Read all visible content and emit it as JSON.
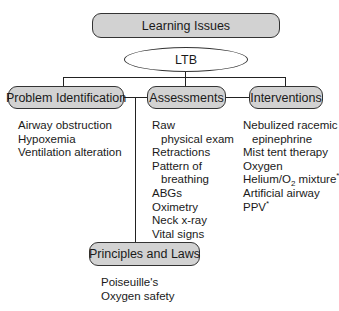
{
  "root": {
    "label": "Learning Issues"
  },
  "center": {
    "label": "LTB"
  },
  "categories": {
    "problem": {
      "label": "Problem Identification",
      "items": [
        "Airway obstruction",
        "Hypoxemia",
        "Ventilation alteration"
      ]
    },
    "assessments": {
      "label": "Assessments",
      "items": [
        "Raw",
        "physical exam",
        "Retractions",
        "Pattern of",
        "breathing",
        "ABGs",
        "Oximetry",
        "Neck x-ray",
        "Vital signs"
      ]
    },
    "interventions": {
      "label": "Interventions",
      "items": [
        "Nebulized racemic",
        "epinephrine",
        "Mist tent therapy",
        "Oxygen",
        "Helium/O",
        "2",
        " mixture",
        "*",
        "Artificial airway",
        "PPV",
        "*"
      ]
    },
    "principles": {
      "label": "Principles and Laws",
      "items": [
        "Poiseuille's",
        "Oxygen safety"
      ]
    }
  }
}
